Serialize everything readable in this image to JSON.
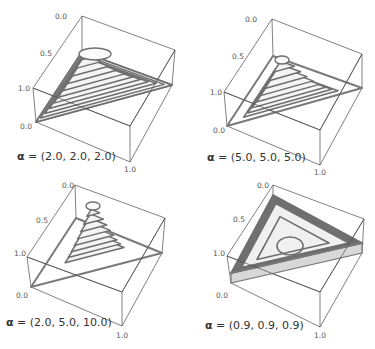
{
  "chart_data": [
    {
      "type": "surface3d",
      "title": "",
      "label_prefix": "α",
      "label_text": " = (2.0, 2.0, 2.0)",
      "alpha": [
        2.0,
        2.0,
        2.0
      ],
      "z_ticks": [
        "0.0",
        "0.5",
        "1.0"
      ],
      "x_ticks": [
        "0.0",
        "1.0"
      ],
      "shape": "dome",
      "box": {
        "back": [
          82,
          16
        ],
        "right": [
          175,
          50
        ],
        "left": [
          33,
          88
        ],
        "front": [
          130,
          126
        ],
        "back_b": [
          82,
          52
        ],
        "right_b": [
          172,
          85
        ],
        "left_b": [
          36,
          122
        ],
        "front_b": [
          130,
          162
        ]
      },
      "peak": [
        85,
        51
      ],
      "label_pos": [
        17,
        160
      ],
      "ticks_pos": {
        "z0": [
          55,
          19
        ],
        "z05": [
          40,
          56
        ],
        "z1": [
          18,
          91
        ],
        "x0": [
          20,
          129
        ],
        "x1": [
          124,
          172
        ]
      }
    },
    {
      "type": "surface3d",
      "title": "",
      "label_prefix": "α",
      "label_text": " = (5.0, 5.0, 5.0)",
      "alpha": [
        5.0,
        5.0,
        5.0
      ],
      "z_ticks": [
        "0.0",
        "0.5",
        "1.0"
      ],
      "x_ticks": [
        "0.0",
        "1.0"
      ],
      "shape": "peak",
      "box": {
        "back": [
          272,
          19
        ],
        "right": [
          362,
          54
        ],
        "left": [
          224,
          92
        ],
        "front": [
          320,
          130
        ],
        "back_b": [
          273,
          56
        ],
        "right_b": [
          362,
          88
        ],
        "left_b": [
          227,
          126
        ],
        "front_b": [
          320,
          165
        ]
      },
      "peak": [
        282,
        57
      ],
      "label_pos": [
        207,
        161
      ],
      "ticks_pos": {
        "z0": [
          245,
          22
        ],
        "z05": [
          232,
          59
        ],
        "z1": [
          210,
          95
        ],
        "x0": [
          213,
          133
        ],
        "x1": [
          314,
          175
        ]
      }
    },
    {
      "type": "surface3d",
      "title": "",
      "label_prefix": "α",
      "label_text": " = (2.0, 5.0, 10.0)",
      "alpha": [
        2.0,
        5.0,
        10.0
      ],
      "z_ticks": [
        "0.0",
        "0.5",
        "1.0"
      ],
      "x_ticks": [
        "0.0",
        "1.0"
      ],
      "shape": "spike",
      "box": {
        "back": [
          75,
          185
        ],
        "right": [
          165,
          218
        ],
        "left": [
          27,
          257
        ],
        "front": [
          122,
          292
        ],
        "back_b": [
          76,
          218
        ],
        "right_b": [
          162,
          253
        ],
        "left_b": [
          31,
          287
        ],
        "front_b": [
          122,
          326
        ]
      },
      "peak": [
        93,
        203
      ],
      "label_pos": [
        6,
        326
      ],
      "ticks_pos": {
        "z0": [
          62,
          188
        ],
        "z05": [
          36,
          223
        ],
        "z1": [
          14,
          256
        ],
        "x0": [
          16,
          298
        ],
        "x1": [
          116,
          338
        ]
      }
    },
    {
      "type": "surface3d",
      "title": "",
      "label_prefix": "α",
      "label_text": " = (0.9, 0.9, 0.9)",
      "alpha": [
        0.9,
        0.9,
        0.9
      ],
      "z_ticks": [
        "0.0",
        "0.5",
        "1.0"
      ],
      "x_ticks": [
        "0.0",
        "1.0"
      ],
      "shape": "bowl",
      "box": {
        "back": [
          273,
          185
        ],
        "right": [
          364,
          219
        ],
        "left": [
          227,
          256
        ],
        "front": [
          320,
          292
        ],
        "back_b": [
          273,
          205
        ],
        "right_b": [
          362,
          253
        ],
        "left_b": [
          231,
          283
        ],
        "front_b": [
          320,
          327
        ]
      },
      "peak": [
        290,
        250
      ],
      "label_pos": [
        205,
        329
      ],
      "ticks_pos": {
        "z0": [
          257,
          188
        ],
        "z05": [
          233,
          222
        ],
        "z1": [
          213,
          256
        ],
        "x0": [
          216,
          298
        ],
        "x1": [
          314,
          338
        ]
      }
    }
  ]
}
